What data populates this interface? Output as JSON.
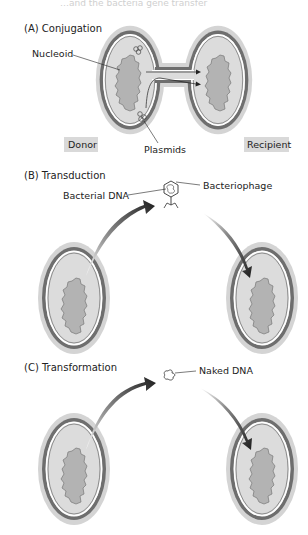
{
  "figure": {
    "top_cutoff_text": "…and the bacteria gene transfer",
    "colors": {
      "halo": "#cfcfcf",
      "wall_dark": "#6e6e6e",
      "membrane_white": "#ffffff",
      "cytoplasm": "#d8d8d8",
      "nucleoid": "#b3b3b3",
      "nucleoid_outline": "#777777",
      "arrow": "#222222",
      "label_box": "#d9d9d9",
      "text": "#222222"
    }
  },
  "panels": [
    {
      "id": "A",
      "title": "(A) Conjugation",
      "labels": {
        "nucleoid": "Nucleoid",
        "plasmids": "Plasmids",
        "donor": "Donor",
        "recipient": "Recipient"
      }
    },
    {
      "id": "B",
      "title": "(B) Transduction",
      "labels": {
        "bacterial_dna": "Bacterial DNA",
        "bacteriophage": "Bacteriophage"
      }
    },
    {
      "id": "C",
      "title": "(C) Transformation",
      "labels": {
        "naked_dna": "Naked DNA"
      }
    }
  ]
}
